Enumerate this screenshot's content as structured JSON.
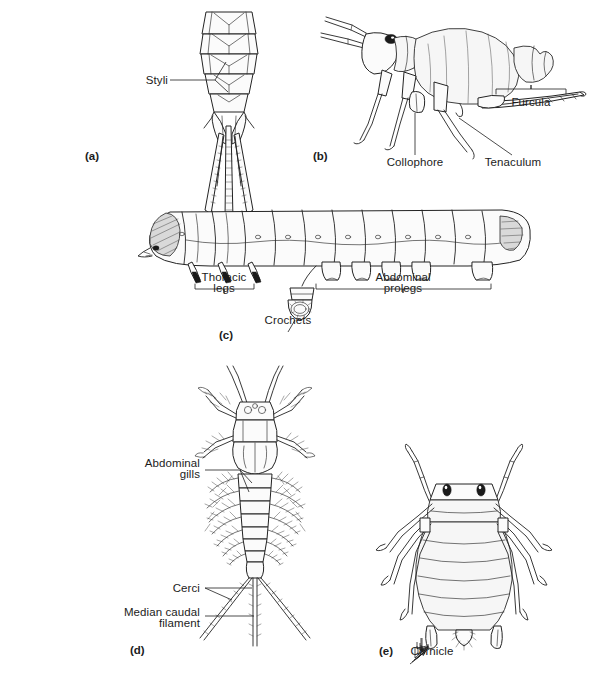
{
  "figure": {
    "background_color": "#ffffff",
    "ink_color": "#232323",
    "width": 592,
    "height": 683
  },
  "panels": [
    {
      "id": "a",
      "panel_label": "(a)",
      "subject": "silverfish-abdomen-ventral",
      "labels": [
        {
          "name": "styli",
          "text": "Styli",
          "align": "right"
        }
      ]
    },
    {
      "id": "b",
      "panel_label": "(b)",
      "subject": "springtail-lateral",
      "labels": [
        {
          "name": "collophore",
          "text": "Collophore",
          "align": "center"
        },
        {
          "name": "tenaculum",
          "text": "Tenaculum",
          "align": "center"
        },
        {
          "name": "furcula",
          "text": "Furcula",
          "align": "center"
        }
      ]
    },
    {
      "id": "c",
      "panel_label": "(c)",
      "subject": "caterpillar-lateral",
      "labels": [
        {
          "name": "thoracic-legs",
          "text": "Thoracic\nlegs",
          "align": "center"
        },
        {
          "name": "crochets",
          "text": "Crochets",
          "align": "center"
        },
        {
          "name": "abdominal-prolegs",
          "text": "Abdominal\nprolegs",
          "align": "center"
        }
      ]
    },
    {
      "id": "d",
      "panel_label": "(d)",
      "subject": "mayfly-nymph-dorsal",
      "labels": [
        {
          "name": "abdominal-gills",
          "text": "Abdominal\ngills",
          "align": "right"
        },
        {
          "name": "cerci",
          "text": "Cerci",
          "align": "right"
        },
        {
          "name": "median-caudal-filament",
          "text": "Median caudal\nfilament",
          "align": "right"
        }
      ]
    },
    {
      "id": "e",
      "panel_label": "(e)",
      "subject": "aphid-dorsal",
      "labels": [
        {
          "name": "cornicle",
          "text": "Cornicle",
          "align": "center"
        }
      ]
    }
  ],
  "text": {
    "styli": "Styli",
    "collophore": "Collophore",
    "tenaculum": "Tenaculum",
    "furcula": "Furcula",
    "thoracic_legs_line1": "Thoracic",
    "thoracic_legs_line2": "legs",
    "crochets": "Crochets",
    "abdominal_prolegs_line1": "Abdominal",
    "abdominal_prolegs_line2": "prolegs",
    "abdominal_gills_line1": "Abdominal",
    "abdominal_gills_line2": "gills",
    "cerci": "Cerci",
    "median_caudal_line1": "Median caudal",
    "median_caudal_line2": "filament",
    "cornicle": "Cornicle",
    "panel_a": "(a)",
    "panel_b": "(b)",
    "panel_c": "(c)",
    "panel_d": "(d)",
    "panel_e": "(e)"
  }
}
